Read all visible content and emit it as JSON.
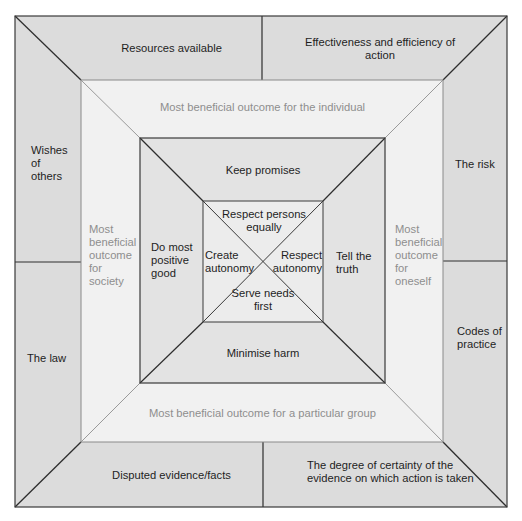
{
  "diagram": {
    "type": "nested-square ethical decision framework",
    "colors": {
      "outer_band": "#dcdcdc",
      "second_band": "#f1f1f1",
      "third_band": "#e3e3e3",
      "inner_square": "#ececec",
      "dark_line": "#3a3a3a",
      "light_line": "#9a9a9a",
      "dark_text": "#1e1e1e",
      "grey_text": "#8e8e8e"
    },
    "outer_band": {
      "top_left": "Resources available",
      "top_right": "Effectiveness and efficiency of action",
      "left_top": "Wishes of others",
      "left_bottom": "The law",
      "right_top": "The risk",
      "right_bottom": "Codes of practice",
      "bottom_left": "Disputed evidence/facts",
      "bottom_right": "The degree of certainty of the evidence on which action is taken"
    },
    "outcome_band": {
      "top": "Most beneficial outcome for the individual",
      "left": "Most beneficial outcome for society",
      "right": "Most beneficial outcome for oneself",
      "bottom": "Most beneficial outcome for a particular group"
    },
    "principles_band": {
      "top": "Keep promises",
      "left": "Do most positive good",
      "right": "Tell the truth",
      "bottom": "Minimise harm"
    },
    "inner_square": {
      "top": "Respect persons equally",
      "left": "Create autonomy",
      "right": "Respect autonomy",
      "bottom": "Serve needs first"
    }
  }
}
